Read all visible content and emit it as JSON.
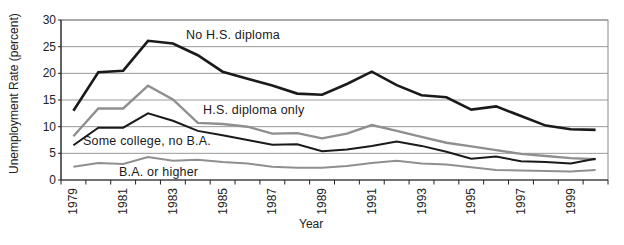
{
  "chart_data": {
    "type": "line",
    "title": "",
    "xlabel": "Year",
    "ylabel": "Unemployment Rate (percent)",
    "x": [
      1979,
      1980,
      1981,
      1982,
      1983,
      1984,
      1985,
      1986,
      1987,
      1988,
      1989,
      1990,
      1991,
      1992,
      1993,
      1994,
      1995,
      1996,
      1997,
      1998,
      1999,
      2000
    ],
    "x_tick_labels": [
      "1979",
      "1981",
      "1983",
      "1985",
      "1987",
      "1989",
      "1991",
      "1993",
      "1995",
      "1997",
      "1999"
    ],
    "yticks": [
      0,
      5,
      10,
      15,
      20,
      25,
      30
    ],
    "ylim": [
      0,
      30
    ],
    "grid": true,
    "legend_position": "in-plot-annotations",
    "colors": {
      "black_line": "#1a1a1a",
      "gray_line": "#8f8f8f",
      "gridline": "#999999",
      "border": "#888888",
      "axis": "#222222"
    },
    "series": [
      {
        "name": "No H.S. diploma",
        "color": "#1a1a1a",
        "stroke_width": 2.6,
        "label_pos": {
          "x": 186,
          "y": 39
        },
        "values": [
          13.0,
          20.2,
          20.5,
          26.1,
          25.6,
          23.4,
          20.3,
          19.0,
          17.7,
          16.2,
          16.0,
          18.0,
          20.3,
          17.8,
          15.9,
          15.5,
          13.2,
          13.8,
          12.0,
          10.2,
          9.5,
          9.4
        ]
      },
      {
        "name": "H.S. diploma only",
        "color": "#8f8f8f",
        "stroke_width": 2.4,
        "label_pos": {
          "x": 203,
          "y": 114
        },
        "values": [
          8.2,
          13.4,
          13.4,
          17.7,
          15.1,
          10.7,
          10.5,
          10.0,
          8.7,
          8.8,
          7.8,
          8.7,
          10.3,
          9.2,
          8.1,
          7.0,
          6.3,
          5.6,
          4.9,
          4.5,
          4.1,
          3.9
        ]
      },
      {
        "name": "Some college, no B.A.",
        "color": "#1a1a1a",
        "stroke_width": 2.0,
        "label_pos": {
          "x": 83,
          "y": 145
        },
        "values": [
          6.5,
          9.8,
          9.8,
          12.5,
          11.1,
          9.2,
          8.4,
          7.5,
          6.6,
          6.7,
          5.4,
          5.7,
          6.4,
          7.2,
          6.4,
          5.3,
          4.0,
          4.4,
          3.5,
          3.4,
          3.1,
          4.0
        ]
      },
      {
        "name": "B.A. or higher",
        "color": "#8f8f8f",
        "stroke_width": 2.0,
        "label_pos": {
          "x": 119,
          "y": 176
        },
        "values": [
          2.5,
          3.2,
          3.0,
          4.3,
          3.6,
          3.8,
          3.4,
          3.1,
          2.5,
          2.3,
          2.3,
          2.6,
          3.2,
          3.6,
          3.1,
          2.9,
          2.4,
          1.9,
          1.8,
          1.7,
          1.6,
          1.9
        ]
      }
    ]
  }
}
